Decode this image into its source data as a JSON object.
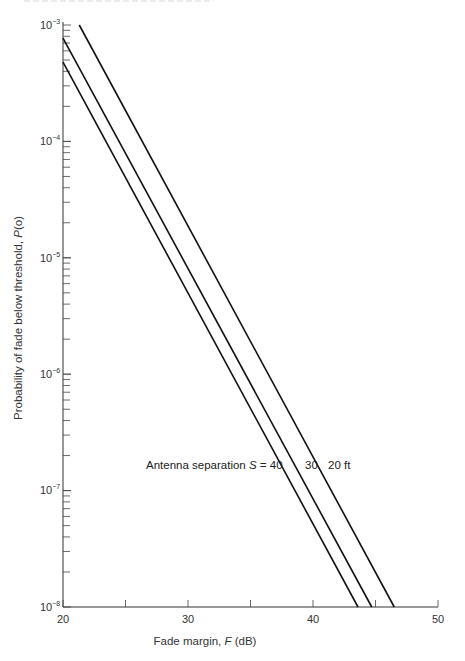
{
  "chart_data": {
    "type": "line",
    "title": "",
    "xlabel": "Fade margin, F (dB)",
    "ylabel": "Probability of fade below threshold, P(o)",
    "xscale": "linear",
    "yscale": "log",
    "xlim": [
      20,
      50
    ],
    "ylim": [
      1e-08,
      0.001
    ],
    "x_ticks": [
      20,
      25,
      30,
      35,
      40,
      45,
      50
    ],
    "x_tick_labels": [
      "20",
      "30",
      "40",
      "50"
    ],
    "y_tick_labels": [
      "10^-3",
      "10^-4",
      "10^-5",
      "10^-6",
      "10^-7",
      "10^-8"
    ],
    "grid": false,
    "legend": null,
    "annotation": "Antenna separation S = 40   30   20 ft",
    "series": [
      {
        "name": "S = 40 ft",
        "x": [
          20,
          43.6
        ],
        "y": [
          0.00048,
          1e-08
        ]
      },
      {
        "name": "S = 30 ft",
        "x": [
          20,
          44.7
        ],
        "y": [
          0.00077,
          1e-08
        ]
      },
      {
        "name": "S = 20 ft",
        "x": [
          21.3,
          46.5
        ],
        "y": [
          0.001,
          1e-08
        ]
      }
    ]
  },
  "labels": {
    "x_axis_title_prefix": "Fade margin, ",
    "x_axis_title_var": "F",
    "x_axis_title_suffix": " (dB)",
    "y_axis_title_prefix": "Probability of fade below threshold, ",
    "y_axis_title_var": "P",
    "y_axis_title_suffix": "(o)",
    "annotation_prefix": "Antenna separation ",
    "annotation_var": "S",
    "annotation_eq": " = 40",
    "annotation_30": "30",
    "annotation_20": "20 ft",
    "x_ticks": [
      "20",
      "30",
      "40",
      "50"
    ],
    "y_base": "10",
    "y_exps": [
      "−3",
      "−4",
      "−5",
      "−6",
      "−7",
      "−8"
    ]
  }
}
